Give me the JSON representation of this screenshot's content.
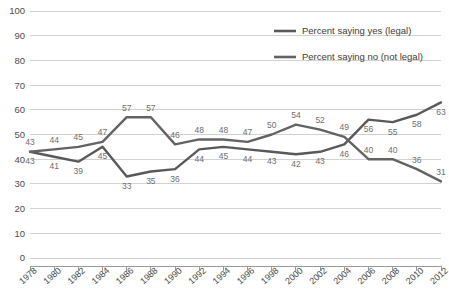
{
  "chart_data": {
    "type": "line",
    "title": "",
    "xlabel": "",
    "ylabel": "",
    "ylim": [
      0,
      100
    ],
    "ytick_step": 10,
    "grid": true,
    "legend_position": "top-right",
    "x": [
      1978,
      1980,
      1982,
      1984,
      1986,
      1988,
      1990,
      1992,
      1994,
      1996,
      1998,
      2000,
      2002,
      2004,
      2006,
      2008,
      2010,
      2012
    ],
    "xtick_labels": [
      "1978",
      "1980",
      "1982",
      "1984",
      "1986",
      "1988",
      "1990",
      "1992",
      "1994",
      "1996",
      "1998",
      "2000",
      "2002",
      "2004",
      "2006",
      "2008",
      "2010",
      "2012"
    ],
    "ytick_labels": [
      "0",
      "10",
      "20",
      "30",
      "40",
      "50",
      "60",
      "70",
      "80",
      "90",
      "100"
    ],
    "ytick_values": [
      0,
      10,
      20,
      30,
      40,
      50,
      60,
      70,
      80,
      90,
      100
    ],
    "series": [
      {
        "name": "Percent saying yes (legal)",
        "color": "#595959",
        "label_position": "below",
        "values": [
          43,
          41,
          39,
          45,
          33,
          35,
          36,
          44,
          45,
          44,
          43,
          42,
          43,
          46,
          56,
          55,
          58,
          63
        ],
        "data_labels": [
          "43",
          "41",
          "39",
          "45",
          "33",
          "35",
          "36",
          "44",
          "45",
          "44",
          "43",
          "42",
          "43",
          "46",
          "56",
          "55",
          "58",
          "63"
        ]
      },
      {
        "name": "Percent saying no (not legal)",
        "color": "#636363",
        "label_position": "above",
        "values": [
          43,
          44,
          45,
          47,
          57,
          57,
          46,
          48,
          48,
          47,
          50,
          54,
          52,
          49,
          40,
          40,
          36,
          31
        ],
        "data_labels": [
          "43",
          "44",
          "45",
          "47",
          "57",
          "57",
          "46",
          "48",
          "48",
          "47",
          "50",
          "54",
          "52",
          "49",
          "40",
          "40",
          "36",
          "31"
        ]
      }
    ]
  },
  "legend": {
    "items": [
      {
        "label": "Percent saying yes (legal)",
        "color": "#595959"
      },
      {
        "label": "Percent saying no (not legal)",
        "color": "#636363"
      }
    ]
  },
  "colors": {
    "grid": "#d2d2d2",
    "axis": "#9a9a9a",
    "tick_text": "#4d4d4d",
    "point_label_text": "#6e6e6e",
    "background": "#ffffff"
  }
}
